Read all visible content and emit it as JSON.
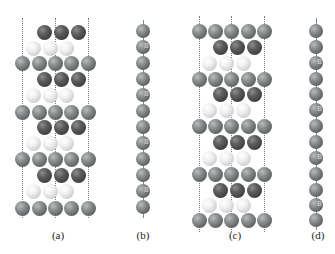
{
  "figure": {
    "panels": [
      {
        "id": "a",
        "label": "(a)",
        "label_pos": [
          58,
          236
        ],
        "type": "slab",
        "dotted_lines": [
          {
            "x": 22,
            "y1": 18,
            "y2": 218
          },
          {
            "x": 55,
            "y1": 18,
            "y2": 218
          },
          {
            "x": 88,
            "y1": 18,
            "y2": 218
          }
        ],
        "rows": [
          {
            "y": 32,
            "kind": "dark",
            "xs": [
              44,
              61,
              78
            ]
          },
          {
            "y": 48,
            "kind": "white",
            "xs": [
              33,
              50,
              66
            ]
          },
          {
            "y": 63,
            "kind": "grey",
            "xs": [
              22,
              39,
              55,
              71,
              88
            ]
          },
          {
            "y": 79,
            "kind": "dark",
            "xs": [
              44,
              61,
              78
            ]
          },
          {
            "y": 95,
            "kind": "white",
            "xs": [
              33,
              50,
              66
            ]
          },
          {
            "y": 112,
            "kind": "grey",
            "xs": [
              22,
              39,
              55,
              71,
              88
            ]
          },
          {
            "y": 127,
            "kind": "dark",
            "xs": [
              44,
              61,
              78
            ]
          },
          {
            "y": 143,
            "kind": "white",
            "xs": [
              33,
              50,
              66
            ]
          },
          {
            "y": 159,
            "kind": "grey",
            "xs": [
              22,
              39,
              55,
              71,
              88
            ]
          },
          {
            "y": 175,
            "kind": "dark",
            "xs": [
              44,
              61,
              78
            ]
          },
          {
            "y": 191,
            "kind": "white",
            "xs": [
              33,
              50,
              66
            ]
          },
          {
            "y": 208,
            "kind": "grey",
            "xs": [
              22,
              39,
              55,
              71,
              88
            ]
          }
        ]
      },
      {
        "id": "b",
        "label": "(b)",
        "label_pos": [
          143,
          236
        ],
        "type": "chain",
        "x": 143,
        "line": {
          "y1": 20,
          "y2": 218
        },
        "atoms": [
          {
            "y": 31,
            "mark": ""
          },
          {
            "y": 47,
            "mark": "B"
          },
          {
            "y": 63,
            "mark": ""
          },
          {
            "y": 79,
            "mark": ""
          },
          {
            "y": 95,
            "mark": "B"
          },
          {
            "y": 111,
            "mark": ""
          },
          {
            "y": 127,
            "mark": ""
          },
          {
            "y": 143,
            "mark": "B"
          },
          {
            "y": 159,
            "mark": ""
          },
          {
            "y": 175,
            "mark": ""
          },
          {
            "y": 191,
            "mark": "B"
          },
          {
            "y": 207,
            "mark": ""
          }
        ]
      },
      {
        "id": "c",
        "label": "(c)",
        "label_pos": [
          235,
          236
        ],
        "type": "slab",
        "dotted_lines": [
          {
            "x": 199,
            "y1": 16,
            "y2": 232
          },
          {
            "x": 231,
            "y1": 16,
            "y2": 232
          },
          {
            "x": 264,
            "y1": 16,
            "y2": 232
          }
        ],
        "rows": [
          {
            "y": 31,
            "kind": "grey",
            "xs": [
              199,
              215,
              231,
              248,
              264
            ]
          },
          {
            "y": 47,
            "kind": "dark",
            "xs": [
              220,
              237,
              254
            ]
          },
          {
            "y": 63,
            "kind": "white",
            "xs": [
              209,
              226,
              243
            ]
          },
          {
            "y": 79,
            "kind": "grey",
            "xs": [
              199,
              215,
              231,
              248,
              264
            ]
          },
          {
            "y": 94,
            "kind": "dark",
            "xs": [
              220,
              237,
              254
            ]
          },
          {
            "y": 110,
            "kind": "white",
            "xs": [
              209,
              226,
              243
            ]
          },
          {
            "y": 126,
            "kind": "grey",
            "xs": [
              199,
              215,
              231,
              248,
              264
            ]
          },
          {
            "y": 142,
            "kind": "dark",
            "xs": [
              220,
              237,
              254
            ]
          },
          {
            "y": 158,
            "kind": "white",
            "xs": [
              209,
              226,
              243
            ]
          },
          {
            "y": 174,
            "kind": "grey",
            "xs": [
              199,
              215,
              231,
              248,
              264
            ]
          },
          {
            "y": 190,
            "kind": "dark",
            "xs": [
              220,
              237,
              254
            ]
          },
          {
            "y": 205,
            "kind": "white",
            "xs": [
              209,
              226,
              243
            ]
          },
          {
            "y": 220,
            "kind": "grey",
            "xs": [
              199,
              215,
              231,
              248,
              264
            ]
          }
        ]
      },
      {
        "id": "d",
        "label": "(d)",
        "label_pos": [
          318,
          236
        ],
        "type": "chain",
        "x": 316,
        "line": {
          "y1": 18,
          "y2": 230
        },
        "atoms": [
          {
            "y": 31,
            "mark": ""
          },
          {
            "y": 47,
            "mark": ""
          },
          {
            "y": 63,
            "mark": "B"
          },
          {
            "y": 79,
            "mark": ""
          },
          {
            "y": 94,
            "mark": ""
          },
          {
            "y": 110,
            "mark": "B"
          },
          {
            "y": 126,
            "mark": ""
          },
          {
            "y": 142,
            "mark": ""
          },
          {
            "y": 158,
            "mark": "B"
          },
          {
            "y": 174,
            "mark": ""
          },
          {
            "y": 190,
            "mark": ""
          },
          {
            "y": 205,
            "mark": "B"
          },
          {
            "y": 220,
            "mark": ""
          }
        ]
      }
    ],
    "atom_diameter": 15,
    "chain_atom_diameter": 14,
    "colors": {
      "grey": "#6e7171",
      "dark": "#474747",
      "white": "#e6e6e6",
      "dotted_line": "#7a7a7a",
      "label": "#222222"
    }
  }
}
